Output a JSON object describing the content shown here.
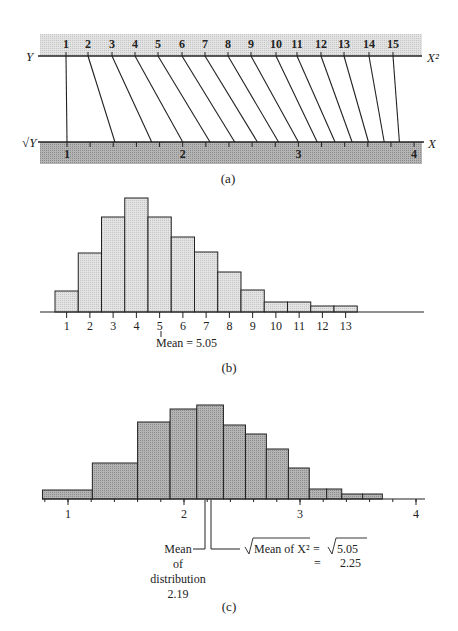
{
  "header_fragment": "",
  "panel_a": {
    "caption": "(a)",
    "top_axis_label_left": "Y",
    "top_axis_label_right": "X²",
    "bottom_axis_label_left": "√Y",
    "bottom_axis_label_right": "X",
    "top_values": [
      1,
      2,
      3,
      4,
      5,
      6,
      7,
      8,
      9,
      10,
      11,
      12,
      13,
      14,
      15
    ],
    "top_label_x": [
      66,
      88,
      112,
      135,
      158,
      182,
      205,
      228,
      251,
      276,
      297,
      321,
      344,
      369,
      393
    ],
    "bottom_ticks": [
      "1",
      "2",
      "3",
      "4"
    ],
    "colors": {
      "band_top": "#d9d9d9",
      "band_bottom": "#a9a9a9",
      "line": "#222222"
    }
  },
  "panel_b": {
    "caption": "(b)",
    "mean_label": "Mean = 5.05",
    "x_ticks": [
      "1",
      "2",
      "3",
      "4",
      "5",
      "6",
      "7",
      "8",
      "9",
      "10",
      "11",
      "12",
      "13"
    ],
    "bar_color": "#dcdcdc"
  },
  "panel_c": {
    "caption": "(c)",
    "x_ticks": [
      "1",
      "2",
      "3",
      "4"
    ],
    "mean_dist_label": [
      "Mean",
      "of",
      "distribution",
      "2.19"
    ],
    "sqrt_mean_label": "Mean of X²",
    "sqrt_eq": "=",
    "sqrt_value": "5.05",
    "result_eq": "=",
    "result_value": "2.25",
    "bar_color": "#a8a8a8"
  },
  "chart_data": [
    {
      "type": "diagram",
      "title": "(a) Mapping of X² scale (Y) onto X = √Y scale",
      "top_scale": {
        "label_left": "Y",
        "label_right": "X²",
        "values": [
          1,
          2,
          3,
          4,
          5,
          6,
          7,
          8,
          9,
          10,
          11,
          12,
          13,
          14,
          15
        ]
      },
      "bottom_scale": {
        "label_left": "√Y",
        "label_right": "X",
        "tick_labels": [
          "1",
          "2",
          "3",
          "4"
        ],
        "range": [
          1,
          4
        ]
      },
      "connections": "Each Y value n connects to √n on bottom scale"
    },
    {
      "type": "bar",
      "title": "(b)",
      "categories": [
        "1",
        "2",
        "3",
        "4",
        "5",
        "6",
        "7",
        "8",
        "9",
        "10",
        "11",
        "12",
        "13"
      ],
      "values": [
        21,
        59,
        95,
        114,
        95,
        75,
        60,
        40,
        22,
        10,
        10,
        6,
        6
      ],
      "annotations": [
        "Mean = 5.05"
      ],
      "xlabel": "",
      "ylabel": "",
      "grid": false
    },
    {
      "type": "bar",
      "title": "(c)",
      "bins": [
        [
          0.78,
          1.21
        ],
        [
          1.21,
          1.6
        ],
        [
          1.6,
          1.88
        ],
        [
          1.88,
          2.11
        ],
        [
          2.11,
          2.34
        ],
        [
          2.34,
          2.53
        ],
        [
          2.53,
          2.71
        ],
        [
          2.71,
          2.9
        ],
        [
          2.9,
          3.08
        ],
        [
          3.08,
          3.23
        ],
        [
          3.23,
          3.36
        ],
        [
          3.36,
          3.54
        ],
        [
          3.54,
          3.71
        ]
      ],
      "values": [
        9,
        36,
        77,
        90,
        94,
        74,
        65,
        50,
        31,
        10,
        10,
        5,
        5
      ],
      "x_tick_labels": [
        "1",
        "2",
        "3",
        "4"
      ],
      "xlim": [
        1,
        4
      ],
      "annotations": [
        "Mean of distribution 2.19",
        "√Mean of X² = √5.05 = 2.25"
      ],
      "grid": false
    }
  ]
}
